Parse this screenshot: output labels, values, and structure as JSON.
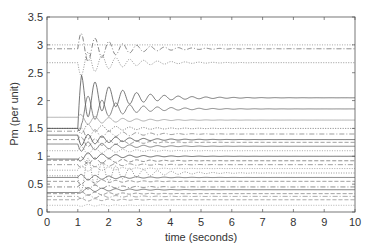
{
  "chart_data": {
    "type": "line",
    "title": "",
    "xlabel": "time (seconds)",
    "ylabel": "Pm (per unit)",
    "xlim": [
      0,
      10
    ],
    "ylim": [
      0,
      3.5
    ],
    "xticks": [
      "0",
      "1",
      "2",
      "3",
      "4",
      "5",
      "6",
      "7",
      "8",
      "9",
      "10"
    ],
    "yticks": [
      "0",
      "0.5",
      "1",
      "1.5",
      "2",
      "2.5",
      "3",
      "3.5"
    ],
    "grid": false,
    "legend": null,
    "disturbance_time": 1.0,
    "series": [
      {
        "name": "trace-1",
        "initial": 3.0,
        "final": 3.0,
        "amp": 0.0,
        "style": "dotted",
        "color": "#888888"
      },
      {
        "name": "trace-2",
        "initial": 2.93,
        "final": 2.93,
        "amp": 0.3,
        "style": "dashdot",
        "color": "#666666"
      },
      {
        "name": "trace-3",
        "initial": 2.68,
        "final": 2.68,
        "amp": 0.25,
        "style": "dotted",
        "color": "#777777"
      },
      {
        "name": "trace-4",
        "initial": 1.5,
        "final": 2.05,
        "amp": 0.45,
        "style": "solid",
        "color": "#555555"
      },
      {
        "name": "trace-5",
        "initial": 1.5,
        "final": 1.85,
        "amp": 0.3,
        "style": "solid",
        "color": "#666666"
      },
      {
        "name": "trace-6",
        "initial": 1.7,
        "final": 1.65,
        "amp": 0.1,
        "style": "solid",
        "color": "#999999"
      },
      {
        "name": "trace-7",
        "initial": 1.5,
        "final": 1.5,
        "amp": 0.1,
        "style": "dotted",
        "color": "#555555"
      },
      {
        "name": "trace-8",
        "initial": 1.45,
        "final": 1.4,
        "amp": 0.12,
        "style": "dashdot",
        "color": "#777777"
      },
      {
        "name": "trace-9",
        "initial": 1.38,
        "final": 1.3,
        "amp": 0.12,
        "style": "solid",
        "color": "#444444"
      },
      {
        "name": "trace-10",
        "initial": 1.3,
        "final": 1.25,
        "amp": 0.1,
        "style": "dashed",
        "color": "#777777"
      },
      {
        "name": "trace-11",
        "initial": 1.22,
        "final": 1.18,
        "amp": 0.1,
        "style": "solid",
        "color": "#666666"
      },
      {
        "name": "trace-12",
        "initial": 1.1,
        "final": 1.1,
        "amp": 0.08,
        "style": "dotted",
        "color": "#888888"
      },
      {
        "name": "trace-13",
        "initial": 0.95,
        "final": 1.0,
        "amp": 0.08,
        "style": "solid",
        "color": "#444444"
      },
      {
        "name": "trace-14",
        "initial": 0.93,
        "final": 0.92,
        "amp": 0.08,
        "style": "dashed",
        "color": "#666666"
      },
      {
        "name": "trace-15",
        "initial": 0.85,
        "final": 0.85,
        "amp": 0.06,
        "style": "dashdot",
        "color": "#777777"
      },
      {
        "name": "trace-16",
        "initial": 0.75,
        "final": 0.78,
        "amp": 0.06,
        "style": "dotted",
        "color": "#888888"
      },
      {
        "name": "trace-17",
        "initial": 0.65,
        "final": 0.7,
        "amp": 0.35,
        "style": "dotted",
        "color": "#777777"
      },
      {
        "name": "trace-18",
        "initial": 0.62,
        "final": 0.62,
        "amp": 0.06,
        "style": "solid",
        "color": "#555555"
      },
      {
        "name": "trace-19",
        "initial": 0.55,
        "final": 0.55,
        "amp": 0.05,
        "style": "dashed",
        "color": "#777777"
      },
      {
        "name": "trace-20",
        "initial": 0.45,
        "final": 0.45,
        "amp": 0.05,
        "style": "dashdot",
        "color": "#666666"
      },
      {
        "name": "trace-21",
        "initial": 0.35,
        "final": 0.4,
        "amp": 0.05,
        "style": "solid",
        "color": "#555555"
      },
      {
        "name": "trace-22",
        "initial": 0.33,
        "final": 0.33,
        "amp": 0.04,
        "style": "dashed",
        "color": "#777777"
      },
      {
        "name": "trace-23",
        "initial": 0.28,
        "final": 0.28,
        "amp": 0.04,
        "style": "dashdot",
        "color": "#888888"
      },
      {
        "name": "trace-24",
        "initial": 0.22,
        "final": 0.22,
        "amp": 0.03,
        "style": "dashed",
        "color": "#888888"
      },
      {
        "name": "trace-25",
        "initial": 0.12,
        "final": 0.12,
        "amp": 0.02,
        "style": "dotted",
        "color": "#999999"
      }
    ]
  },
  "layout": {
    "plot_left": 47,
    "plot_right": 355,
    "plot_top": 17,
    "plot_bottom": 212,
    "osc_period": 0.45,
    "osc_decay": 0.55
  }
}
